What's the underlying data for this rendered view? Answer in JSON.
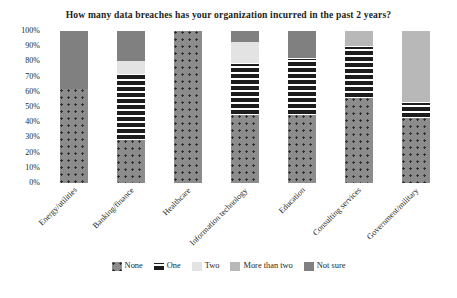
{
  "chart_data": {
    "type": "bar",
    "subtype": "100% stacked bar",
    "title": "How many data breaches has your organization incurred in the past 2 years?",
    "xlabel": "",
    "ylabel": "",
    "ylim": [
      0,
      100
    ],
    "grid": false,
    "legend_position": "bottom",
    "ytick_labels": [
      "0%",
      "10%",
      "20%",
      "30%",
      "40%",
      "50%",
      "60%",
      "70%",
      "80%",
      "90%",
      "100%"
    ],
    "ytick_values": [
      0,
      10,
      20,
      30,
      40,
      50,
      60,
      70,
      80,
      90,
      100
    ],
    "categories": [
      "Energy/utilities",
      "Banking/finance",
      "Healthcare",
      "Information technology",
      "Education",
      "Consulting services",
      "Government/military"
    ],
    "series": [
      {
        "name": "None",
        "color": "#8c8c8c",
        "pattern": "dots",
        "values": [
          62,
          28,
          100,
          45,
          45,
          56,
          43
        ]
      },
      {
        "name": "One",
        "color": "#1d1d1d",
        "pattern": "white-squares",
        "values": [
          0,
          44,
          0,
          34,
          37,
          34,
          10
        ]
      },
      {
        "name": "Two",
        "color": "#e3e3e3",
        "pattern": "solid",
        "values": [
          0,
          8,
          0,
          14,
          0,
          0,
          0
        ]
      },
      {
        "name": "More than two",
        "color": "#b8b8b8",
        "pattern": "solid",
        "values": [
          0,
          0,
          0,
          0,
          0,
          10,
          47
        ]
      },
      {
        "name": "Not sure",
        "color": "#808080",
        "pattern": "solid",
        "values": [
          38,
          20,
          0,
          7,
          18,
          0,
          0
        ]
      }
    ]
  }
}
